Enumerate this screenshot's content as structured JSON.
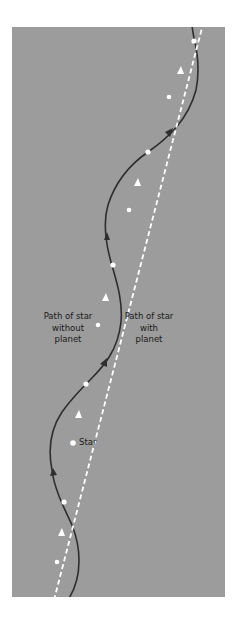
{
  "diagram": {
    "type": "stellar wobble / astrometric path diagram",
    "background_color": "#9c9c9c",
    "path_with_planet_color": "#2e2e2e",
    "path_without_planet_color": "#ffffff",
    "labels": {
      "without_planet": [
        "Path of star",
        "without",
        "planet"
      ],
      "with_planet": [
        "Path of star",
        "with",
        "planet"
      ],
      "star": "Star"
    },
    "paths": [
      {
        "name": "path-without-planet",
        "style": "dashed white straight line",
        "from": [
          55,
          597
        ],
        "to": [
          202,
          27
        ]
      },
      {
        "name": "path-with-planet",
        "style": "solid dark sinusoidal curve",
        "from": [
          68,
          597
        ],
        "to": [
          192,
          27
        ]
      }
    ],
    "intersections": [
      [
        64,
        502
      ],
      [
        86,
        384
      ],
      [
        113,
        265
      ],
      [
        148,
        152
      ],
      [
        194,
        41
      ]
    ],
    "star_marker": [
      73,
      443
    ]
  }
}
